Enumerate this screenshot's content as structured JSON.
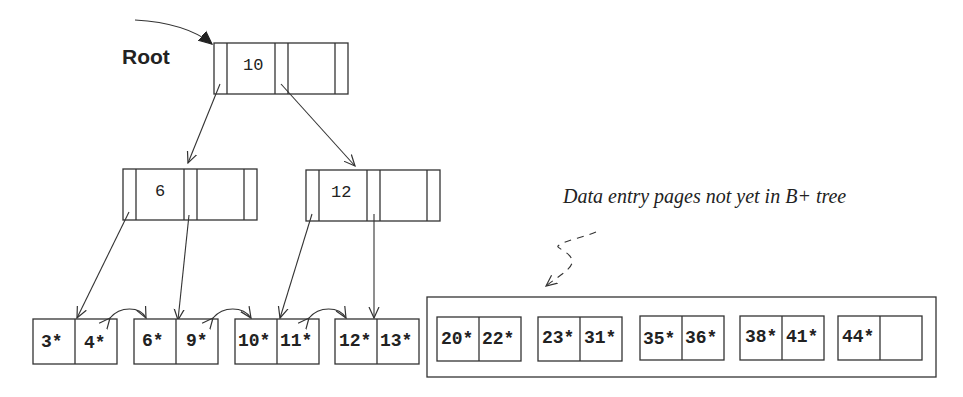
{
  "diagram": {
    "root_label": "Root",
    "caption": "Data entry pages not yet in B+ tree",
    "root_node": {
      "keys": [
        "10"
      ]
    },
    "index_nodes": [
      {
        "keys": [
          "6"
        ]
      },
      {
        "keys": [
          "12"
        ]
      }
    ],
    "leaf_pages": [
      {
        "entries": [
          "3*",
          "4*"
        ]
      },
      {
        "entries": [
          "6*",
          "9*"
        ]
      },
      {
        "entries": [
          "10*",
          "11*"
        ]
      },
      {
        "entries": [
          "12*",
          "13*"
        ]
      }
    ],
    "pending_pages": [
      {
        "entries": [
          "20*",
          "22*"
        ]
      },
      {
        "entries": [
          "23*",
          "31*"
        ]
      },
      {
        "entries": [
          "35*",
          "36*"
        ]
      },
      {
        "entries": [
          "38*",
          "41*"
        ]
      },
      {
        "entries": [
          "44*",
          ""
        ]
      }
    ]
  }
}
